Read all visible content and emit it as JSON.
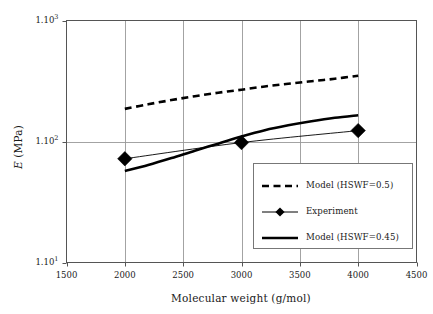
{
  "chart_data": {
    "type": "line",
    "title": "",
    "xlabel": "Molecular weight (g/mol)",
    "ylabel": "E (MPa)",
    "ylabel_italic_symbol": "E",
    "ylabel_unit": " (MPa)",
    "xscale": "linear",
    "yscale": "log",
    "xlim": [
      1500,
      4500
    ],
    "ylim": [
      10,
      1000
    ],
    "xticks": [
      1500,
      2000,
      2500,
      3000,
      3500,
      4000,
      4500
    ],
    "xticklabels": [
      "1500",
      "2000",
      "2500",
      "3000",
      "3500",
      "4000",
      "4500"
    ],
    "yticks": [
      10,
      100,
      1000
    ],
    "yticklabels": [
      "1.10",
      "1.10",
      "1.10"
    ],
    "yticksuper": [
      "1",
      "2",
      "3"
    ],
    "grid": true,
    "grid_axes": "both",
    "legend_position": "lower right",
    "series": [
      {
        "name": "Model (HSWF=0.5)",
        "style": "dashed",
        "color": "#000000",
        "marker": "none",
        "x": [
          2000,
          2200,
          2400,
          2600,
          2800,
          3000,
          3200,
          3400,
          3600,
          3800,
          4000
        ],
        "values": [
          186,
          203,
          220,
          237,
          253,
          268,
          285,
          300,
          315,
          330,
          350
        ]
      },
      {
        "name": "Experiment",
        "style": "thin-solid",
        "color": "#000000",
        "marker": "diamond",
        "x": [
          2000,
          3000,
          4000
        ],
        "values": [
          72,
          98,
          123
        ]
      },
      {
        "name": "Model (HSWF=0.45)",
        "style": "thick-solid",
        "color": "#000000",
        "marker": "none",
        "x": [
          2000,
          2200,
          2400,
          2600,
          2800,
          3000,
          3200,
          3400,
          3600,
          3800,
          4000
        ],
        "values": [
          57,
          64,
          73,
          84,
          96,
          110,
          124,
          136,
          147,
          157,
          165
        ]
      }
    ]
  },
  "legend": {
    "entries": [
      {
        "label": "Model (HSWF=0.5)",
        "style": "dashed",
        "marker": "none"
      },
      {
        "label": "Experiment",
        "style": "thin-solid",
        "marker": "diamond"
      },
      {
        "label": "Model (HSWF=0.45)",
        "style": "thick-solid",
        "marker": "none"
      }
    ]
  },
  "colors": {
    "ink": "#000000",
    "axis": "#555555",
    "grid": "#999999",
    "background": "#ffffff"
  }
}
